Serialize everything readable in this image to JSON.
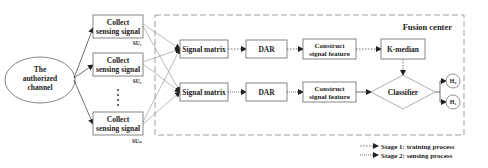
{
  "diagram": {
    "source": {
      "label_lines": [
        "The",
        "authorized",
        "channel"
      ]
    },
    "secondary_users": [
      {
        "label_lines": [
          "Collect",
          "sensing signal"
        ],
        "tag": "SU₁"
      },
      {
        "label_lines": [
          "Collect",
          "sensing signal"
        ],
        "tag": "SU₂"
      },
      {
        "label_lines": [
          "Collect",
          "sensing signal"
        ],
        "tag": "SUₙ"
      }
    ],
    "ellipsis": "⋮",
    "fusion_center": {
      "title": "Fusion center",
      "rows": [
        {
          "signal_matrix": "Signal matrix",
          "dar": "DAR",
          "feature_lines": [
            "Construct",
            "signal feature"
          ]
        },
        {
          "signal_matrix": "Signal matrix",
          "dar": "DAR",
          "feature_lines": [
            "Construct",
            "signal feature"
          ]
        }
      ],
      "kmedian": "K-median",
      "classifier": "Classifier",
      "outputs": [
        "H₀",
        "H₁"
      ]
    },
    "legend": [
      {
        "style": "dotted",
        "label": "Stage 1: training process"
      },
      {
        "style": "dotted-fine",
        "label": "Stage 2: sensing process"
      }
    ],
    "colors": {
      "stroke": "#666666",
      "text": "#222222",
      "arrow": "#333333"
    }
  }
}
